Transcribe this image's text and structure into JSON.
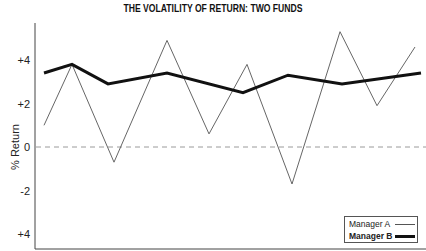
{
  "chart_data": {
    "type": "line",
    "title": "THE VOLATILITY OF RETURN: TWO FUNDS",
    "xlabel": "",
    "ylabel": "% Return",
    "ylim": [
      -4.6,
      5.6
    ],
    "yticks": [
      {
        "value": 4,
        "label": "+4"
      },
      {
        "value": 2,
        "label": "+2"
      },
      {
        "value": 0,
        "label": "0"
      },
      {
        "value": -2,
        "label": "-2"
      },
      {
        "value": -4,
        "label": "+4"
      }
    ],
    "zero_line": {
      "value": 0,
      "style": "dashed"
    },
    "grid": false,
    "legend_position": "lower right",
    "series": [
      {
        "name": "Manager A",
        "style": "thin",
        "x": [
          44,
          72,
          114,
          167,
          209,
          247,
          292,
          340,
          377,
          415
        ],
        "values": [
          1.0,
          3.8,
          -0.7,
          4.9,
          0.6,
          3.8,
          -1.7,
          5.3,
          1.9,
          4.6
        ]
      },
      {
        "name": "Manager B",
        "style": "thick",
        "x": [
          44,
          72,
          108,
          167,
          243,
          288,
          342,
          421
        ],
        "values": [
          3.4,
          3.8,
          2.9,
          3.4,
          2.5,
          3.3,
          2.9,
          3.4
        ]
      }
    ]
  },
  "legend": {
    "items": [
      {
        "label": "Manager A"
      },
      {
        "label": "Manager B"
      }
    ]
  }
}
